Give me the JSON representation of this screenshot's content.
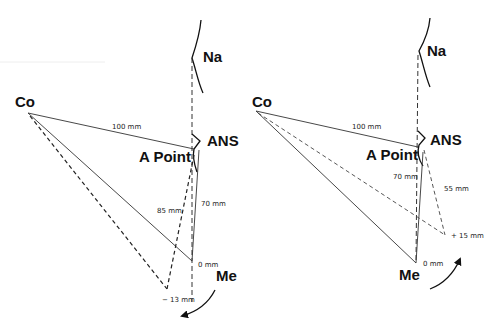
{
  "panels": [
    {
      "id": "left",
      "description": "Clockwise rotation (mandibular posterior rotation)",
      "labels": {
        "na": "Na",
        "co": "Co",
        "ans": "ANS",
        "a_point": "A Point",
        "me": "Me",
        "co_a": "100 mm",
        "co_me_new": "85 mm",
        "a_me": "70 mm",
        "me_orig": "0 mm",
        "me_new": "− 13 mm"
      },
      "rotation": "clockwise"
    },
    {
      "id": "right",
      "description": "Counter-clockwise rotation (mandibular anterior rotation)",
      "labels": {
        "na": "Na",
        "co": "Co",
        "ans": "ANS",
        "a_point": "A Point",
        "me": "Me",
        "co_a": "100 mm",
        "a_me": "70 mm",
        "a_me_new": "55 mm",
        "me_orig": "0 mm",
        "me_new": "+ 15 mm"
      },
      "rotation": "counter-clockwise"
    }
  ],
  "colors": {
    "line": "#333333",
    "text": "#111111"
  }
}
